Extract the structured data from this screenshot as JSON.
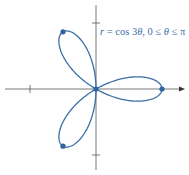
{
  "chart_data": {
    "type": "line",
    "subtype": "polar-curve",
    "title": "r = cos 3θ, 0 ≤ θ ≤ π",
    "equation": "r = cos 3θ",
    "domain": "0 ≤ θ ≤ π",
    "xlabel": "",
    "ylabel": "",
    "xlim": [
      -1.4,
      1.35
    ],
    "ylim": [
      -1.25,
      1.3
    ],
    "ticks": {
      "x": [
        -1
      ],
      "y": [
        1,
        -1
      ]
    },
    "grid": false,
    "legend": "none",
    "series": [
      {
        "name": "r = cos 3θ",
        "color": "#3a6fa8",
        "theta_range": [
          0,
          3.14159
        ],
        "marked_points": [
          {
            "x": 1,
            "y": 0
          },
          {
            "x": -0.5,
            "y": 0.866
          },
          {
            "x": -0.5,
            "y": -0.866
          },
          {
            "x": 0,
            "y": 0
          }
        ]
      }
    ]
  },
  "colors": {
    "curve": "#3a6fa8",
    "axes": "#555555"
  },
  "label_parts": {
    "lhs": "r",
    "rhs": " = cos 3",
    "theta": "θ",
    "range": ", 0 ≤ ",
    "theta2": "θ",
    "range2": " ≤ π"
  }
}
